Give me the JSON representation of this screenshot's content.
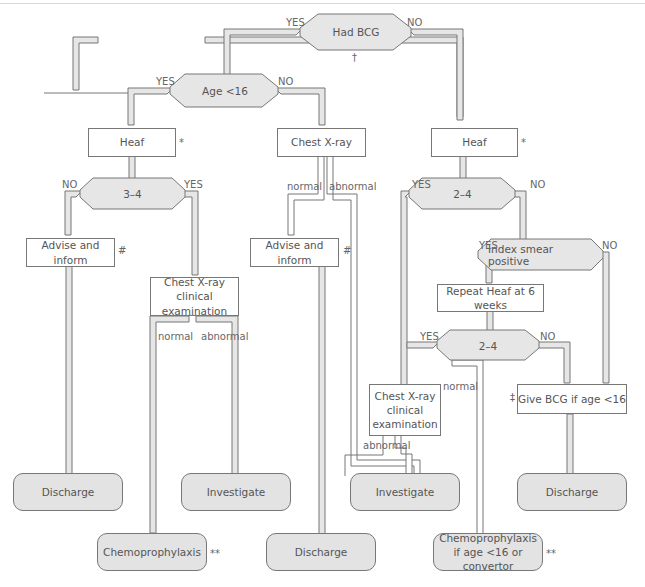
{
  "decisions": {
    "had_bcg": {
      "label": "Had BCG",
      "yes": "YES",
      "no": "NO",
      "note": "†"
    },
    "age_lt16": {
      "label": "Age <16",
      "yes": "YES",
      "no": "NO"
    },
    "heaf_3_4": {
      "label": "3–4",
      "yes": "YES",
      "no": "NO"
    },
    "heaf_2_4": {
      "label": "2–4",
      "yes": "YES",
      "no": "NO"
    },
    "index_smear": {
      "label": "Index smear positive",
      "yes": "YES",
      "no": "NO"
    },
    "repeat_2_4": {
      "label": "2–4",
      "yes": "YES",
      "no": "NO"
    }
  },
  "boxes": {
    "heaf_left": {
      "label": "Heaf",
      "note": "*"
    },
    "chest_xray_mid": {
      "label": "Chest X-ray"
    },
    "heaf_right": {
      "label": "Heaf",
      "note": "*"
    },
    "advise_left": {
      "label": "Advise and inform",
      "note": "#"
    },
    "advise_mid": {
      "label": "Advise and inform",
      "note": "#"
    },
    "chest_clinical_left": {
      "label": "Chest X-ray clinical examination"
    },
    "repeat_heaf": {
      "label": "Repeat Heaf at 6 weeks"
    },
    "chest_clinical_right": {
      "label": "Chest X-ray clinical examination"
    },
    "give_bcg": {
      "label": "Give BCG if age <16",
      "note": "‡"
    }
  },
  "branch_labels": {
    "mid_normal": "normal",
    "mid_abnormal": "abnormal",
    "left_normal": "normal",
    "left_abnormal": "abnormal",
    "right_normal": "normal",
    "right_abnormal": "abnormal"
  },
  "outcomes": {
    "discharge_1": {
      "label": "Discharge"
    },
    "investigate_1": {
      "label": "Investigate"
    },
    "investigate_2": {
      "label": "Investigate"
    },
    "discharge_2": {
      "label": "Discharge"
    },
    "chemoprophylaxis": {
      "label": "Chemoprophylaxis",
      "note": "**"
    },
    "discharge_3": {
      "label": "Discharge"
    },
    "chemo_conditional": {
      "label": "Chemoprophylaxis if age <16 or convertor",
      "note": "**"
    }
  },
  "colors": {
    "pipe_fill": "#e6e6e6",
    "outline": "#777777",
    "terminal_fill": "#e3e3e3"
  }
}
